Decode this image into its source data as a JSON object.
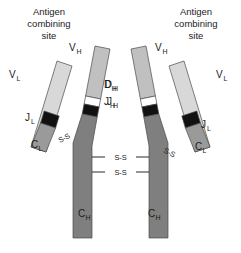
{
  "figure": {
    "background": "#ffffff"
  },
  "colors": {
    "variable_light": "#d8d8d8",
    "variable_heavy": "#c0c0c0",
    "constant_light": "#9a9a9a",
    "constant_heavy": "#7f7f7f",
    "j_segment": "#111111",
    "d_segment": "#ffffff",
    "outline": "#4a4a4a",
    "text": "#1c1c1c"
  },
  "labels": {
    "antigen_site_left": {
      "line1": "Antigen",
      "line2": "combining",
      "line3": "site"
    },
    "antigen_site_right": {
      "line1": "Antigen",
      "line2": "combining",
      "line3": "site"
    },
    "v_light_left": {
      "base": "V",
      "sub": "L"
    },
    "v_light_right": {
      "base": "V",
      "sub": "L"
    },
    "j_light_left": {
      "base": "J",
      "sub": "L"
    },
    "j_light_right": {
      "base": "J",
      "sub": "L"
    },
    "c_light_left": {
      "base": "C",
      "sub": "L"
    },
    "c_light_right": {
      "base": "C",
      "sub": "L"
    },
    "v_heavy_left": {
      "base": "V",
      "sub": "H"
    },
    "v_heavy_right": {
      "base": "V",
      "sub": "H"
    },
    "d_heavy_left": {
      "base": "D",
      "sub": "H"
    },
    "d_heavy_right": {
      "base": "D",
      "sub": "H"
    },
    "j_heavy_left": {
      "base": "J",
      "sub": "H"
    },
    "j_heavy_right": {
      "base": "J",
      "sub": "H"
    },
    "c_heavy_left": {
      "base": "C",
      "sub": "H"
    },
    "c_heavy_right": {
      "base": "C",
      "sub": "H"
    }
  },
  "disulfide_bonds": {
    "label": "S-S",
    "hinge_upper": "S-S",
    "hinge_lower": "S-S",
    "light_heavy_left": "S-S",
    "light_heavy_right": "S-S"
  }
}
